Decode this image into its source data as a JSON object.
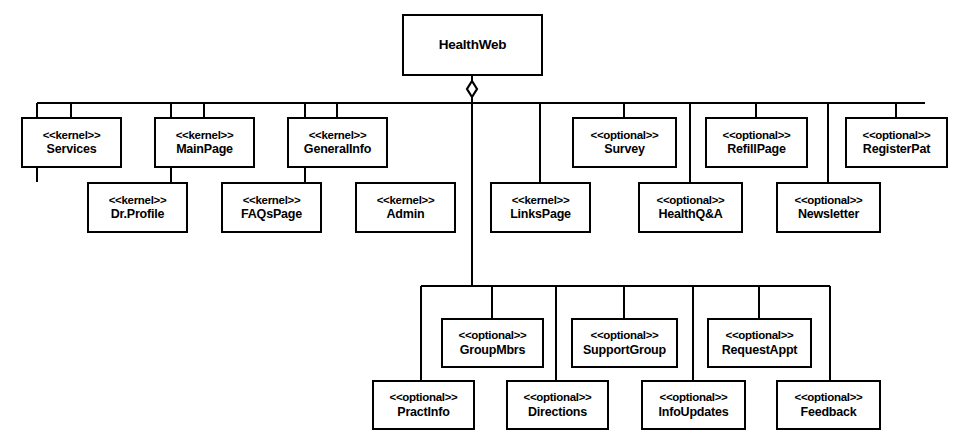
{
  "diagram": {
    "type": "uml-feature-model",
    "title": "HealthWeb",
    "notation": {
      "aggregation_symbol": "diamond",
      "stereotype_kernel": "<<kernel>>",
      "stereotype_optional": "<<optional>>"
    },
    "colors": {
      "background": "#ffffff",
      "stroke": "#000000",
      "text": "#000000"
    },
    "root": {
      "name": "HealthWeb",
      "stereotype": ""
    },
    "nodes": [
      {
        "id": "services",
        "stereotype": "<<kernel>>",
        "name": "Services",
        "x": 21,
        "y": 117,
        "w": 101,
        "h": 51,
        "row": 1
      },
      {
        "id": "mainpage",
        "stereotype": "<<kernel>>",
        "name": "MainPage",
        "x": 154,
        "y": 117,
        "w": 101,
        "h": 51,
        "row": 1
      },
      {
        "id": "generalinfo",
        "stereotype": "<<kernel>>",
        "name": "GeneralInfo",
        "x": 287,
        "y": 117,
        "w": 101,
        "h": 51,
        "row": 1
      },
      {
        "id": "survey",
        "stereotype": "<<optional>>",
        "name": "Survey",
        "x": 572,
        "y": 117,
        "w": 105,
        "h": 51,
        "row": 1
      },
      {
        "id": "refillpage",
        "stereotype": "<<optional>>",
        "name": "RefillPage",
        "x": 705,
        "y": 117,
        "w": 103,
        "h": 51,
        "row": 1
      },
      {
        "id": "registerpat",
        "stereotype": "<<optional>>",
        "name": "RegisterPat",
        "x": 845,
        "y": 117,
        "w": 103,
        "h": 51,
        "row": 1
      },
      {
        "id": "drprofile",
        "stereotype": "<<kernel>>",
        "name": "Dr.Profile",
        "x": 87,
        "y": 182,
        "w": 101,
        "h": 51,
        "row": 2
      },
      {
        "id": "faqspage",
        "stereotype": "<<kernel>>",
        "name": "FAQsPage",
        "x": 221,
        "y": 182,
        "w": 101,
        "h": 51,
        "row": 2
      },
      {
        "id": "admin",
        "stereotype": "<<kernel>>",
        "name": "Admin",
        "x": 355,
        "y": 182,
        "w": 101,
        "h": 51,
        "row": 2
      },
      {
        "id": "linkspage",
        "stereotype": "<<kernel>>",
        "name": "LinksPage",
        "x": 490,
        "y": 182,
        "w": 101,
        "h": 51,
        "row": 2
      },
      {
        "id": "healthqa",
        "stereotype": "<<optional>>",
        "name": "HealthQ&A",
        "x": 638,
        "y": 182,
        "w": 105,
        "h": 51,
        "row": 2
      },
      {
        "id": "newsletter",
        "stereotype": "<<optional>>",
        "name": "Newsletter",
        "x": 776,
        "y": 182,
        "w": 105,
        "h": 51,
        "row": 2
      },
      {
        "id": "groupmbrs",
        "stereotype": "<<optional>>",
        "name": "GroupMbrs",
        "x": 441,
        "y": 318,
        "w": 103,
        "h": 50,
        "row": 3
      },
      {
        "id": "supportgroup",
        "stereotype": "<<optional>>",
        "name": "SupportGroup",
        "x": 571,
        "y": 318,
        "w": 107,
        "h": 50,
        "row": 3
      },
      {
        "id": "requestappt",
        "stereotype": "<<optional>>",
        "name": "RequestAppt",
        "x": 707,
        "y": 318,
        "w": 105,
        "h": 50,
        "row": 3
      },
      {
        "id": "practinfo",
        "stereotype": "<<optional>>",
        "name": "PractInfo",
        "x": 372,
        "y": 380,
        "w": 103,
        "h": 50,
        "row": 4
      },
      {
        "id": "directions",
        "stereotype": "<<optional>>",
        "name": "Directions",
        "x": 506,
        "y": 380,
        "w": 103,
        "h": 50,
        "row": 4
      },
      {
        "id": "infoupdates",
        "stereotype": "<<optional>>",
        "name": "InfoUpdates",
        "x": 641,
        "y": 380,
        "w": 105,
        "h": 50,
        "row": 4
      },
      {
        "id": "feedback",
        "stereotype": "<<optional>>",
        "name": "Feedback",
        "x": 776,
        "y": 380,
        "w": 105,
        "h": 50,
        "row": 4
      }
    ],
    "root_box": {
      "x": 402,
      "y": 14,
      "w": 141,
      "h": 62
    },
    "edges": {
      "top_bus": {
        "y": 103,
        "x1": 37,
        "x2": 925
      },
      "bottom_bus": {
        "y": 286,
        "x1": 421,
        "x2": 830
      },
      "root_stem": {
        "x": 472,
        "y1": 76,
        "y2": 103
      },
      "center_stem": {
        "x": 472,
        "y1": 103,
        "y2": 286
      },
      "diamond": {
        "cx": 472,
        "cy": 89,
        "rx": 5,
        "ry": 8
      },
      "row1_drops": [
        71,
        204,
        337,
        624,
        756,
        896
      ],
      "row2_drops": [
        37,
        171,
        305,
        540,
        690,
        828
      ],
      "row3_drops": [
        492,
        624,
        759
      ],
      "row4_drops": [
        421,
        556,
        693,
        830
      ]
    }
  }
}
